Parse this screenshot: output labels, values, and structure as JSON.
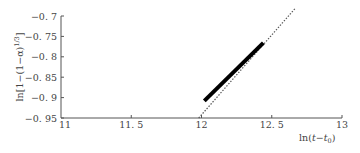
{
  "chart_data": {
    "type": "line",
    "title": "",
    "xlabel": "ln(t−t₀)",
    "ylabel": "ln[1−(1−α)¹ᐟ³]",
    "xlim": [
      11,
      13
    ],
    "ylim": [
      -0.95,
      -0.7
    ],
    "x_ticks": [
      11,
      11.5,
      12,
      12.5,
      13
    ],
    "x_tick_labels": [
      "11",
      "11. 5",
      "12",
      "12. 5",
      "13"
    ],
    "y_ticks": [
      -0.7,
      -0.75,
      -0.8,
      -0.85,
      -0.9,
      -0.95
    ],
    "y_tick_labels": [
      "−0. 7",
      "−0. 75",
      "−0. 8",
      "−0. 85",
      "−0. 9",
      "−0. 95"
    ],
    "grid": false,
    "legend": null,
    "series": [
      {
        "name": "experimental data",
        "style": "solid-thick",
        "color": "#000000",
        "x": [
          12.02,
          12.44
        ],
        "y": [
          -0.908,
          -0.766
        ]
      },
      {
        "name": "linear fit",
        "style": "dotted",
        "color": "#555555",
        "x": [
          11.98,
          12.67
        ],
        "y": [
          -0.95,
          -0.68
        ]
      }
    ]
  },
  "axes": {
    "x_label_main": "ln(",
    "x_label_var": "t",
    "x_label_minus": "−",
    "x_label_t0": "t",
    "x_label_sub": "0",
    "x_label_close": ")",
    "y_label_text": "ln[1−(1−α)",
    "y_label_sup": "1/3",
    "y_label_close": "]"
  }
}
